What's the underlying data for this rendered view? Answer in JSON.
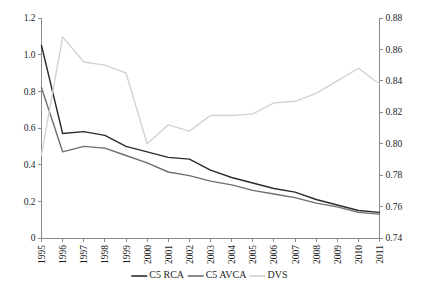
{
  "chart_data": {
    "type": "line",
    "title": "",
    "xlabel": "",
    "ylabel": "",
    "grid": false,
    "legend_position": "bottom",
    "categories": [
      "1995",
      "1996",
      "1997",
      "1998",
      "1999",
      "2000",
      "2001",
      "2002",
      "2003",
      "2004",
      "2005",
      "2006",
      "2007",
      "2008",
      "2009",
      "2010",
      "2011"
    ],
    "axes": {
      "left": {
        "label": "",
        "ylim": [
          0,
          1.2
        ],
        "ticks": [
          "0",
          "0.2",
          "0.4",
          "0.6",
          "0.8",
          "1.0",
          "1.2"
        ],
        "tick_values": [
          0,
          0.2,
          0.4,
          0.6,
          0.8,
          1.0,
          1.2
        ]
      },
      "right": {
        "label": "",
        "ylim": [
          0.74,
          0.88
        ],
        "ticks": [
          "0.74",
          "0.76",
          "0.78",
          "0.80",
          "0.82",
          "0.84",
          "0.86",
          "0.88"
        ],
        "tick_values": [
          0.74,
          0.76,
          0.78,
          0.8,
          0.82,
          0.84,
          0.86,
          0.88
        ]
      }
    },
    "series": [
      {
        "name": "C5 RCA",
        "axis": "left",
        "color": "#2b2b2b",
        "values": [
          1.05,
          0.57,
          0.58,
          0.56,
          0.5,
          0.47,
          0.44,
          0.43,
          0.37,
          0.33,
          0.3,
          0.27,
          0.25,
          0.21,
          0.18,
          0.15,
          0.14
        ]
      },
      {
        "name": "C5 AVCA",
        "axis": "left",
        "color": "#6e6e6e",
        "values": [
          0.82,
          0.47,
          0.5,
          0.49,
          0.45,
          0.41,
          0.36,
          0.34,
          0.31,
          0.29,
          0.26,
          0.24,
          0.22,
          0.19,
          0.17,
          0.14,
          0.13
        ]
      },
      {
        "name": "DVS",
        "axis": "right",
        "color": "#d3d3d3",
        "values": [
          0.793,
          0.868,
          0.852,
          0.85,
          0.845,
          0.8,
          0.812,
          0.808,
          0.818,
          0.818,
          0.819,
          0.826,
          0.827,
          0.832,
          0.84,
          0.848,
          0.838
        ]
      }
    ]
  },
  "legend": {
    "items": [
      {
        "label": "C5 RCA",
        "color": "#2b2b2b"
      },
      {
        "label": "C5 AVCA",
        "color": "#6e6e6e"
      },
      {
        "label": "DVS",
        "color": "#d3d3d3"
      }
    ]
  }
}
